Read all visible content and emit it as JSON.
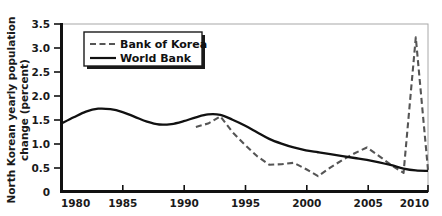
{
  "chart_data": {
    "type": "line",
    "title": "",
    "subtitle": "",
    "xlabel": "",
    "ylabel": "North Korean yearly population change (percent)",
    "ylabel_line1": "North Korean yearly population",
    "ylabel_line2": "change (percent)",
    "xlim": [
      1980,
      2010
    ],
    "ylim": [
      0,
      3.5
    ],
    "grid": false,
    "legend_position": "top-left",
    "xticks": [
      1980,
      1985,
      1990,
      1995,
      2000,
      2005,
      2010
    ],
    "xtick_labels": [
      "1980",
      "1985",
      "1990",
      "1995",
      "2000",
      "2005",
      "2010"
    ],
    "yticks": [
      0,
      0.5,
      1.0,
      1.5,
      2.0,
      2.5,
      3.0,
      3.5
    ],
    "ytick_labels": [
      "0",
      "0.5",
      "1.0",
      "1.5",
      "2.0",
      "2.5",
      "3.0",
      "3.5"
    ],
    "series": [
      {
        "name": "Bank of Korea",
        "style": "dashed",
        "color": "#555555",
        "x": [
          1991,
          1992,
          1993,
          1994,
          1995,
          1996,
          1997,
          1998,
          1999,
          2000,
          2001,
          2002,
          2003,
          2004,
          2005,
          2006,
          2007,
          2008,
          2009,
          2010
        ],
        "values": [
          1.35,
          1.42,
          1.57,
          1.24,
          0.98,
          0.74,
          0.56,
          0.57,
          0.6,
          0.47,
          0.32,
          0.5,
          0.66,
          0.8,
          0.92,
          0.74,
          0.55,
          0.39,
          3.22,
          0.45
        ]
      },
      {
        "name": "World Bank",
        "style": "solid",
        "color": "#111111",
        "x": [
          1980,
          1981,
          1982,
          1983,
          1984,
          1985,
          1986,
          1987,
          1988,
          1989,
          1990,
          1991,
          1992,
          1993,
          1994,
          1995,
          1996,
          1997,
          1998,
          1999,
          2000,
          2001,
          2002,
          2003,
          2004,
          2005,
          2006,
          2007,
          2008,
          2009,
          2010
        ],
        "values": [
          1.42,
          1.55,
          1.67,
          1.73,
          1.72,
          1.66,
          1.56,
          1.46,
          1.4,
          1.41,
          1.47,
          1.55,
          1.61,
          1.6,
          1.5,
          1.38,
          1.24,
          1.1,
          1.0,
          0.92,
          0.86,
          0.82,
          0.78,
          0.74,
          0.7,
          0.66,
          0.61,
          0.55,
          0.48,
          0.44,
          0.43
        ]
      }
    ]
  },
  "legend": {
    "items": [
      {
        "label": "Bank of Korea",
        "style": "dashed"
      },
      {
        "label": "World Bank",
        "style": "solid"
      }
    ]
  },
  "colors": {
    "bank_of_korea": "#555555",
    "world_bank": "#111111",
    "axis": "#111111",
    "frame": "#9a9a9a",
    "background": "#ffffff"
  }
}
